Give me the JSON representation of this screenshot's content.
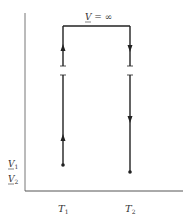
{
  "diagram": {
    "type": "process path diagram",
    "top_label": "V = ∞",
    "top_label_var": "V",
    "top_label_rest": " = ∞",
    "y_labels": [
      {
        "var": "V",
        "sub": "1"
      },
      {
        "var": "V",
        "sub": "2"
      }
    ],
    "x_labels": [
      {
        "var": "T",
        "sub": "1"
      },
      {
        "var": "T",
        "sub": "2"
      }
    ],
    "paths": [
      {
        "name": "left-path",
        "at": "T1",
        "from": "V1",
        "to": "V = ∞",
        "direction": "up",
        "broken": true
      },
      {
        "name": "top-path",
        "from": "T1",
        "to": "T2",
        "at": "V = ∞",
        "direction": "right"
      },
      {
        "name": "right-path",
        "at": "T2",
        "from": "V = ∞",
        "to": "V2",
        "direction": "down",
        "broken": true
      }
    ],
    "colors": {
      "line": "#222222",
      "axis": "#666666",
      "text": "#333333"
    }
  }
}
